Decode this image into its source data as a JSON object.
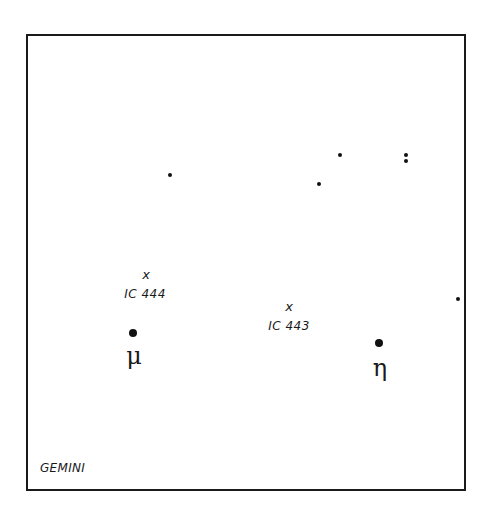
{
  "map": {
    "constellation": "GEMINI",
    "stars": [
      {
        "id": "star-1",
        "x": 170,
        "y": 175,
        "size": "sm"
      },
      {
        "id": "star-2",
        "x": 340,
        "y": 155,
        "size": "sm"
      },
      {
        "id": "star-3",
        "x": 319,
        "y": 184,
        "size": "sm"
      },
      {
        "id": "star-4a",
        "x": 406,
        "y": 155,
        "size": "sm"
      },
      {
        "id": "star-4b",
        "x": 406,
        "y": 161,
        "size": "sm"
      },
      {
        "id": "star-5",
        "x": 458,
        "y": 299,
        "size": "sm"
      },
      {
        "id": "mu",
        "x": 133,
        "y": 333,
        "size": "lg"
      },
      {
        "id": "eta",
        "x": 379,
        "y": 343,
        "size": "lg"
      }
    ],
    "named_stars": {
      "mu": {
        "symbol": "μ",
        "label_x": 134,
        "label_y": 344
      },
      "eta": {
        "symbol": "η",
        "label_x": 380,
        "label_y": 356
      }
    },
    "objects": {
      "ic444": {
        "marker": "x",
        "name": "IC 444",
        "x": 146,
        "y": 268,
        "name_y": 288
      },
      "ic443": {
        "marker": "x",
        "name": "IC 443",
        "x": 289,
        "y": 300,
        "name_y": 320
      }
    }
  }
}
